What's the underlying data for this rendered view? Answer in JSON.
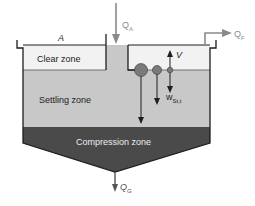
{
  "diagram": {
    "zones": {
      "clear": "Clear zone",
      "settling": "Settling zone",
      "compression": "Compression zone"
    },
    "labels": {
      "area": "A",
      "inflow": "Q",
      "inflow_sub": "A",
      "effluent": "Q",
      "effluent_sub": "F",
      "sludge": "Q",
      "sludge_sub": "G",
      "upflow_velocity": "V",
      "settling_velocity": "w",
      "settling_velocity_sub": "St,t"
    },
    "colors": {
      "clear_zone": "#f2f2f2",
      "settling_zone": "#c8c8c8",
      "compression_zone": "#4a4a4a",
      "outline": "#1e1e1e",
      "arrow_gray": "#8a8a8a",
      "particle": "#7a7a7a",
      "text_dark": "#222222",
      "text_light": "#eeeeee"
    }
  }
}
